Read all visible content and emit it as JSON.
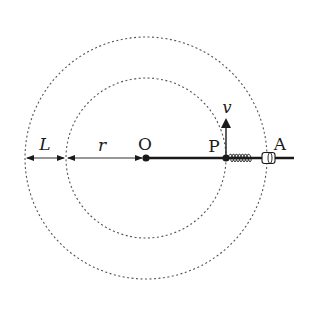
{
  "diagram": {
    "type": "physics-rotating-rod",
    "colors": {
      "ink": "#1a1a1a",
      "dashed": "#555555",
      "background": "#ffffff"
    },
    "center": {
      "label": "O",
      "x": 146,
      "y": 158
    },
    "inner_circle": {
      "radius": 80,
      "style": "dotted"
    },
    "outer_circle": {
      "radius": 121,
      "style": "dotted"
    },
    "point_p": {
      "label": "P",
      "x": 226,
      "y": 158
    },
    "point_a": {
      "label": "A",
      "x": 267,
      "y": 158
    },
    "velocity": {
      "label": "v",
      "direction": "up"
    },
    "dimensions": [
      {
        "label": "L",
        "from_x": 25,
        "to_x": 66
      },
      {
        "label": "r",
        "from_x": 66,
        "to_x": 146
      }
    ],
    "components": [
      "rod",
      "spring",
      "sleeve"
    ]
  }
}
